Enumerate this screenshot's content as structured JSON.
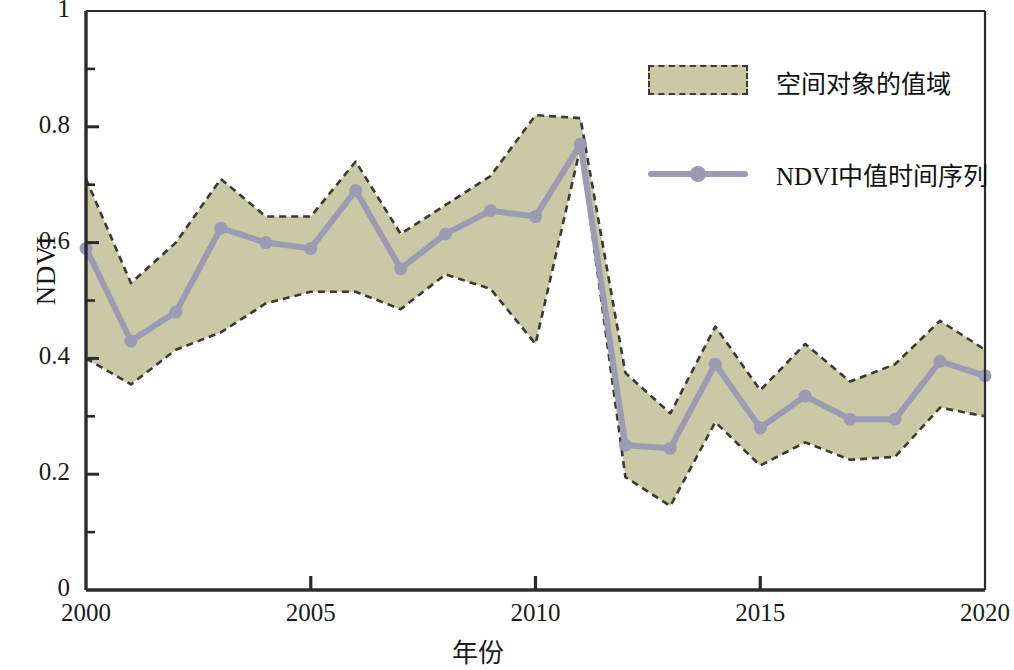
{
  "chart_data": {
    "type": "area",
    "title": "",
    "xlabel": "年份",
    "ylabel": "NDVI",
    "xlim": [
      2000,
      2020
    ],
    "ylim": [
      0,
      1
    ],
    "grid": false,
    "legend_position": "top-right",
    "x": [
      2000,
      2001,
      2002,
      2003,
      2004,
      2005,
      2006,
      2007,
      2008,
      2009,
      2010,
      2011,
      2012,
      2013,
      2014,
      2015,
      2016,
      2017,
      2018,
      2019,
      2020
    ],
    "xtick_labels": [
      "2000",
      "2005",
      "2010",
      "2015",
      "2020"
    ],
    "xticks": [
      2000,
      2005,
      2010,
      2015,
      2020
    ],
    "ytick_labels": [
      "0",
      "0.2",
      "0.4",
      "0.6",
      "0.8",
      "1"
    ],
    "yticks": [
      0,
      0.2,
      0.4,
      0.6,
      0.8,
      1
    ],
    "yticks_minor": [
      0.1,
      0.3,
      0.5,
      0.7,
      0.9
    ],
    "series": [
      {
        "name": "空间对象的值域",
        "type": "band",
        "upper": [
          0.71,
          0.53,
          0.6,
          0.71,
          0.645,
          0.645,
          0.74,
          0.615,
          0.665,
          0.715,
          0.82,
          0.815,
          0.375,
          0.305,
          0.455,
          0.345,
          0.425,
          0.36,
          0.39,
          0.465,
          0.415
        ],
        "lower": [
          0.4,
          0.355,
          0.415,
          0.445,
          0.495,
          0.515,
          0.515,
          0.485,
          0.545,
          0.52,
          0.425,
          0.765,
          0.195,
          0.145,
          0.29,
          0.215,
          0.255,
          0.225,
          0.23,
          0.315,
          0.3
        ],
        "fill_color": "#c9c9a6",
        "edge_color": "#3a3a30",
        "edge_style": "dashed"
      },
      {
        "name": "NDVI中值时间序列",
        "type": "line",
        "values": [
          0.59,
          0.43,
          0.48,
          0.625,
          0.6,
          0.59,
          0.69,
          0.555,
          0.615,
          0.655,
          0.645,
          0.77,
          0.25,
          0.245,
          0.39,
          0.28,
          0.335,
          0.295,
          0.295,
          0.395,
          0.37
        ],
        "line_color": "#9b9cb4",
        "marker": "circle",
        "marker_color": "#9b9cb4"
      }
    ]
  },
  "axes": {
    "y_title": "NDVI",
    "x_title": "年份"
  },
  "legend": {
    "items": [
      {
        "label": "空间对象的值域",
        "kind": "band"
      },
      {
        "label": "NDVI中值时间序列",
        "kind": "line"
      }
    ]
  },
  "colors": {
    "band_fill": "#c9c9a6",
    "band_edge": "#3a3a30",
    "line": "#9b9cb4",
    "axis": "#2b2b2b",
    "text": "#1a1a1a"
  }
}
